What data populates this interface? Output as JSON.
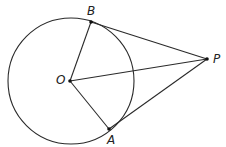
{
  "diagram": {
    "type": "geometry",
    "circle": {
      "center": "O",
      "cx": 71,
      "cy": 81,
      "r": 63
    },
    "points": {
      "O": {
        "label": "O",
        "x": 70,
        "y": 81
      },
      "A": {
        "label": "A",
        "x": 109,
        "y": 129
      },
      "B": {
        "label": "B",
        "x": 91,
        "y": 22
      },
      "P": {
        "label": "P",
        "x": 207,
        "y": 59
      }
    },
    "segments": [
      {
        "from": "O",
        "to": "B"
      },
      {
        "from": "O",
        "to": "A"
      },
      {
        "from": "O",
        "to": "P"
      },
      {
        "from": "B",
        "to": "P"
      },
      {
        "from": "A",
        "to": "P"
      }
    ],
    "colors": {
      "stroke": "#2a2a2a",
      "point": "#111111",
      "background": "#ffffff"
    }
  }
}
